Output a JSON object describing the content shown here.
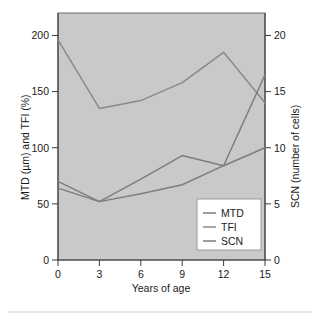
{
  "chart_data": {
    "type": "line",
    "title": "",
    "xlabel": "Years of age",
    "ylabel": "MTD (µm) and TFI (%)",
    "y2label": "SCN (number of cells)",
    "x": [
      0,
      3,
      6,
      9,
      12,
      15
    ],
    "xlim": [
      0,
      15
    ],
    "ylim": [
      0,
      220
    ],
    "y2lim": [
      0,
      22
    ],
    "xticks": [
      "0",
      "3",
      "6",
      "9",
      "12",
      "15"
    ],
    "yticks": [
      "0",
      "50",
      "100",
      "150",
      "200"
    ],
    "ytick_values": [
      0,
      50,
      100,
      150,
      200
    ],
    "y2ticks": [
      "0",
      "5",
      "10",
      "15",
      "20"
    ],
    "y2tick_values": [
      0,
      5,
      10,
      15,
      20
    ],
    "grid": false,
    "legend_position": "lower right",
    "plot_background": "#c9c9c9",
    "series": [
      {
        "name": "MTD",
        "axis": "left",
        "color": "#7d7d7d",
        "values": [
          70,
          52,
          59,
          67,
          84,
          100
        ]
      },
      {
        "name": "TFI",
        "axis": "left",
        "color": "#8a8a8a",
        "values": [
          196,
          135,
          142,
          158,
          185,
          140
        ]
      },
      {
        "name": "SCN",
        "axis": "right",
        "color": "#7d7d7d",
        "values": [
          6.4,
          5.2,
          7.2,
          9.3,
          8.4,
          16.5
        ]
      }
    ]
  },
  "legend": {
    "entries": [
      "MTD",
      "TFI",
      "SCN"
    ]
  }
}
